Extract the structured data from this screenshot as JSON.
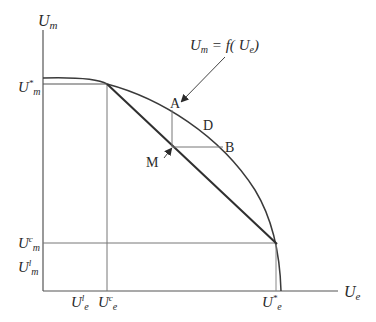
{
  "diagram": {
    "type": "utility-possibility-frontier",
    "colors": {
      "line": "#3a3a3a",
      "thin": "#6a6a6a",
      "text": "#2a2a2a"
    },
    "axes": {
      "y_label": {
        "base": "U",
        "sub": "m"
      },
      "x_label": {
        "base": "U",
        "sub": "e"
      }
    },
    "curve_label": "U_m = f(U_e)",
    "curve_label_parts": {
      "lhs_base": "U",
      "lhs_sub": "m",
      "eq": " = f( ",
      "rhs_base": "U",
      "rhs_sub": "e",
      "close": ")"
    },
    "y_ticks": [
      {
        "base": "U",
        "sup": "*",
        "sub": "m"
      },
      {
        "base": "U",
        "sup": "c",
        "sub": "m"
      },
      {
        "base": "U",
        "sup": "l",
        "sub": "m"
      }
    ],
    "x_ticks": [
      {
        "base": "U",
        "sup": "l",
        "sub": "e"
      },
      {
        "base": "U",
        "sup": "c",
        "sub": "e"
      },
      {
        "base": "U",
        "sup": "*",
        "sub": "e"
      }
    ],
    "points": {
      "A": "A",
      "B": "B",
      "D": "D",
      "M": "M"
    }
  }
}
